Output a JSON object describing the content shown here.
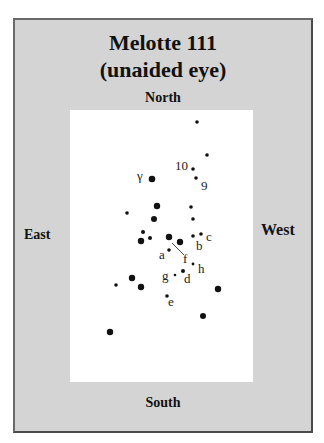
{
  "chart": {
    "title": "Melotte 111",
    "subtitle": "(unaided eye)",
    "directions": {
      "north": "North",
      "south": "South",
      "east": "East",
      "west": "West"
    }
  },
  "colors": {
    "panel": "#d4d4d4",
    "field": "#ffffff",
    "star": "#111111"
  },
  "stars": [
    {
      "x": 197,
      "y": 122,
      "r": 1.8
    },
    {
      "x": 207,
      "y": 155,
      "r": 1.8
    },
    {
      "x": 193,
      "y": 169,
      "r": 1.8,
      "label": "10",
      "lx": 175,
      "ly": 170
    },
    {
      "x": 196,
      "y": 178,
      "r": 1.8,
      "label": "9",
      "lx": 201,
      "ly": 190
    },
    {
      "x": 152,
      "y": 179,
      "r": 3.3,
      "label": "γ",
      "lx": 137,
      "ly": 180
    },
    {
      "x": 127,
      "y": 213,
      "r": 1.8
    },
    {
      "x": 157,
      "y": 206,
      "r": 3.2
    },
    {
      "x": 154,
      "y": 219,
      "r": 3.0
    },
    {
      "x": 191,
      "y": 207,
      "r": 1.8
    },
    {
      "x": 193,
      "y": 219,
      "r": 1.8
    },
    {
      "x": 143,
      "y": 232,
      "r": 2.0
    },
    {
      "x": 141,
      "y": 241,
      "r": 3.2
    },
    {
      "x": 150,
      "y": 238,
      "r": 2.0
    },
    {
      "x": 169,
      "y": 237,
      "r": 3.2
    },
    {
      "x": 180,
      "y": 242,
      "r": 3.2
    },
    {
      "x": 193,
      "y": 236,
      "r": 1.8,
      "label": "b",
      "lx": 196,
      "ly": 250
    },
    {
      "x": 201,
      "y": 234,
      "r": 1.8,
      "label": "c",
      "lx": 206,
      "ly": 241
    },
    {
      "x": 169,
      "y": 250,
      "r": 1.8,
      "label": "a",
      "lx": 159,
      "ly": 259
    },
    {
      "x": 193,
      "y": 264,
      "r": 1.4,
      "label": "h",
      "lx": 198,
      "ly": 273
    },
    {
      "x": 175,
      "y": 275,
      "r": 1.3,
      "label": "g",
      "lx": 162,
      "ly": 280
    },
    {
      "x": 183,
      "y": 271,
      "r": 2.0,
      "label": "d",
      "lx": 184,
      "ly": 283
    },
    {
      "x": 218,
      "y": 289,
      "r": 3.2
    },
    {
      "x": 167,
      "y": 296,
      "r": 1.8,
      "label": "e",
      "lx": 168,
      "ly": 306
    },
    {
      "x": 116,
      "y": 285,
      "r": 1.8
    },
    {
      "x": 132,
      "y": 278,
      "r": 3.2
    },
    {
      "x": 141,
      "y": 287,
      "r": 3.2
    },
    {
      "x": 203,
      "y": 316,
      "r": 3.0
    },
    {
      "x": 110,
      "y": 332,
      "r": 3.2
    }
  ],
  "leader_lines": [
    {
      "x1": 172,
      "y1": 243,
      "x2": 184,
      "y2": 255,
      "label": "f",
      "lx": 183,
      "ly": 263
    }
  ]
}
